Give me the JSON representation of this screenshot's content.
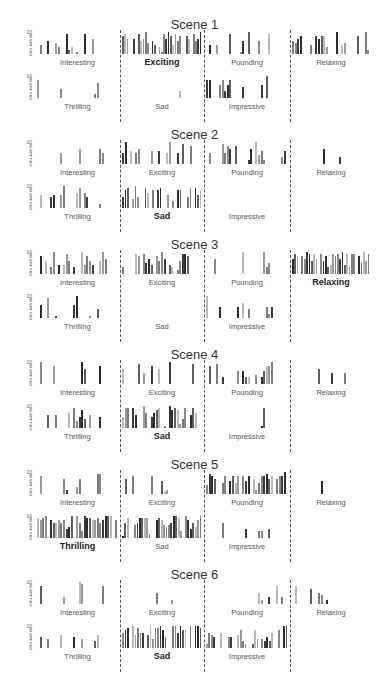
{
  "chart_data": {
    "type": "bar",
    "ylim": [
      0,
      10
    ],
    "yticks": [
      "10",
      "8",
      "6",
      "4",
      "2",
      "0"
    ],
    "categories_top_row": [
      "Interesting",
      "Exciting",
      "Pounding",
      "Relaxing"
    ],
    "categories_bottom_row": [
      "Thrilling",
      "Sad",
      "Impressive"
    ],
    "scenes": [
      {
        "title": "Scene 1",
        "highlight": "Exciting",
        "panels": {
          "Interesting": [
            0,
            4,
            0,
            0,
            6,
            0,
            0,
            5,
            3,
            0,
            0,
            9,
            2,
            3,
            0,
            1,
            0,
            0,
            9,
            0,
            0,
            7
          ],
          "Exciting": [
            8,
            9,
            7,
            0,
            0,
            7,
            0,
            9,
            6,
            7,
            10,
            5,
            0,
            6,
            4,
            0,
            3,
            1,
            9,
            7,
            10,
            8,
            4,
            9,
            6,
            8,
            0,
            0,
            8,
            7,
            0,
            9,
            6,
            7,
            10
          ],
          "Pounding": [
            0,
            4,
            0,
            0,
            4,
            0,
            0,
            0,
            0,
            9,
            0,
            0,
            0,
            1,
            6,
            0,
            10,
            0,
            0,
            0,
            6,
            0,
            0,
            0,
            9
          ],
          "Relaxing": [
            6,
            5,
            7,
            8,
            0,
            0,
            0,
            4,
            0,
            8,
            7,
            8,
            8,
            3,
            0,
            0,
            0,
            10,
            0,
            4,
            5,
            0,
            0,
            0,
            0,
            8,
            0,
            0,
            10,
            2
          ]
        },
        "panels_bottom": {
          "Thrilling": [
            8,
            0,
            0,
            0,
            0,
            0,
            0,
            0,
            0,
            4,
            0,
            0,
            0,
            0,
            0,
            0,
            0,
            0,
            0,
            0,
            0,
            0,
            2,
            7
          ],
          "Sad": [
            0,
            0,
            0,
            0,
            0,
            0,
            0,
            0,
            0,
            0,
            0,
            0,
            0,
            0,
            0,
            0,
            0,
            0,
            0,
            0,
            0,
            0,
            3,
            0
          ],
          "Impressive": [
            8,
            8,
            0,
            0,
            0,
            6,
            8,
            3,
            6,
            8,
            0,
            0,
            0,
            0,
            5,
            0,
            0,
            0,
            0,
            0,
            0,
            6,
            0,
            10
          ]
        }
      },
      {
        "title": "Scene 2",
        "highlight": "Sad",
        "panels": {
          "Interesting": [
            0,
            0,
            0,
            0,
            0,
            0,
            0,
            0,
            0,
            5,
            0,
            0,
            0,
            0,
            0,
            0,
            7,
            0,
            0,
            0,
            0,
            0,
            0,
            0,
            7,
            5
          ],
          "Exciting": [
            5,
            10,
            0,
            6,
            0,
            5,
            7,
            0,
            0,
            0,
            0,
            6,
            0,
            0,
            6,
            0,
            0,
            5,
            10,
            0,
            0,
            5,
            0,
            9,
            0,
            0,
            8
          ],
          "Pounding": [
            0,
            5,
            0,
            0,
            0,
            0,
            9,
            5,
            8,
            7,
            0,
            8,
            0,
            0,
            0,
            0,
            2,
            7,
            0,
            10,
            4,
            6,
            2,
            0,
            0,
            0,
            0,
            0,
            0,
            3,
            6
          ],
          "Relaxing": [
            0,
            0,
            0,
            0,
            0,
            0,
            0,
            0,
            0,
            0,
            0,
            0,
            7,
            0,
            0,
            0,
            0,
            0,
            3
          ]
        },
        "panels_bottom": {
          "Thrilling": [
            0,
            6,
            0,
            0,
            0,
            5,
            6,
            0,
            0,
            6,
            10,
            0,
            0,
            0,
            0,
            7,
            9,
            0,
            7,
            5,
            0,
            0,
            0,
            0,
            2
          ],
          "Sad": [
            5,
            8,
            9,
            0,
            4,
            10,
            5,
            0,
            0,
            9,
            7,
            0,
            8,
            0,
            8,
            9,
            0,
            0,
            6,
            0,
            3,
            0,
            8,
            8,
            0,
            0,
            5,
            9,
            0,
            9,
            6,
            8
          ],
          "Impressive": []
        }
      },
      {
        "title": "Scene 3",
        "highlight": "Relaxing",
        "panels": {
          "Interesting": [
            0,
            8,
            0,
            6,
            0,
            3,
            10,
            0,
            4,
            0,
            4,
            9,
            6,
            0,
            3,
            0,
            0,
            10,
            4,
            8,
            6,
            4,
            0,
            0,
            6,
            10,
            7
          ],
          "Exciting": [
            3,
            0,
            0,
            0,
            0,
            9,
            8,
            0,
            9,
            5,
            7,
            4,
            0,
            8,
            6,
            10,
            7,
            0,
            4,
            3,
            0,
            2,
            6,
            9,
            9,
            8
          ],
          "Pounding": [
            0,
            0,
            0,
            7,
            0,
            0,
            0,
            0,
            0,
            0,
            0,
            0,
            0,
            0,
            10,
            0,
            0,
            0,
            0,
            0,
            0,
            0,
            10,
            3,
            5
          ],
          "Relaxing": [
            7,
            9,
            8,
            0,
            8,
            7,
            10,
            9,
            6,
            9,
            7,
            0,
            9,
            6,
            8,
            3,
            4,
            9,
            8,
            9,
            7,
            10,
            4,
            9,
            3,
            9,
            9,
            0,
            8,
            5,
            10,
            6,
            9
          ]
        },
        "panels_bottom": {
          "Thrilling": [
            0,
            6,
            0,
            0,
            9,
            0,
            0,
            1,
            0,
            0,
            0,
            0,
            0,
            0,
            6,
            11,
            0,
            0,
            0,
            0,
            1,
            0,
            0,
            4
          ],
          "Sad": [],
          "Impressive": [
            10,
            0,
            0,
            0,
            0,
            5,
            0,
            0,
            0,
            0,
            0,
            0,
            5,
            0,
            7,
            0,
            4,
            0,
            0,
            0,
            0,
            0,
            0,
            5,
            2,
            5
          ]
        }
      },
      {
        "title": "Scene 4",
        "highlight": "Sad",
        "panels": {
          "Interesting": [
            0,
            10,
            0,
            0,
            0,
            0,
            8,
            0,
            0,
            0,
            0,
            0,
            0,
            0,
            0,
            0,
            0,
            10,
            7,
            0,
            0,
            0,
            0,
            0,
            8
          ],
          "Exciting": [
            7,
            0,
            0,
            0,
            0,
            0,
            9,
            0,
            5,
            0,
            0,
            8,
            0,
            0,
            7,
            0,
            0,
            0,
            10,
            0,
            0,
            0,
            0,
            0,
            0,
            0,
            0,
            9
          ],
          "Pounding": [
            0,
            8,
            0,
            0,
            9,
            0,
            3,
            0,
            0,
            0,
            0,
            0,
            6,
            0,
            6,
            3,
            3,
            0,
            0,
            4,
            0,
            3,
            6,
            8,
            8,
            11
          ],
          "Relaxing": [
            0,
            0,
            0,
            0,
            0,
            0,
            0,
            0,
            0,
            0,
            7,
            0,
            0,
            0,
            0,
            5,
            0,
            0,
            0,
            0,
            5
          ]
        },
        "panels_bottom": {
          "Thrilling": [
            0,
            0,
            0,
            0,
            6,
            0,
            0,
            6,
            0,
            0,
            0,
            0,
            7,
            0,
            9,
            3,
            5,
            8,
            4,
            0,
            6,
            0,
            0,
            0,
            5
          ],
          "Sad": [
            5,
            9,
            9,
            0,
            9,
            6,
            0,
            0,
            10,
            7,
            0,
            5,
            7,
            8,
            9,
            0,
            1,
            0,
            10,
            8,
            9,
            8,
            2,
            4,
            9,
            0,
            6,
            9,
            7
          ],
          "Impressive": [
            0,
            0,
            0,
            0,
            0,
            0,
            0,
            0,
            0,
            0,
            0,
            0,
            0,
            0,
            0,
            0,
            0,
            0,
            0,
            0,
            0,
            1,
            9
          ]
        }
      },
      {
        "title": "Scene 5",
        "highlight": "Thrilling",
        "panels": {
          "Interesting": [
            0,
            8,
            0,
            0,
            0,
            0,
            0,
            0,
            0,
            0,
            7,
            2,
            0,
            0,
            0,
            3,
            7,
            0,
            0,
            0,
            0,
            0,
            0,
            9,
            9
          ],
          "Exciting": [
            0,
            7,
            0,
            0,
            8,
            0,
            0,
            0,
            0,
            0,
            0,
            8,
            0,
            0,
            0,
            6,
            1,
            2
          ],
          "Pounding": [
            4,
            9,
            8,
            7,
            0,
            0,
            5,
            8,
            0,
            6,
            8,
            5,
            8,
            0,
            8,
            6,
            8,
            0,
            7,
            2,
            5,
            8,
            8,
            9,
            7,
            8,
            0,
            7,
            8,
            8,
            10
          ],
          "Relaxing": [
            0,
            0,
            0,
            0,
            0,
            0,
            0,
            0,
            0,
            0,
            0,
            6
          ]
        },
        "panels_bottom": {
          "Thrilling": [
            9,
            8,
            9,
            10,
            0,
            8,
            7,
            7,
            8,
            7,
            8,
            4,
            5,
            10,
            0,
            10,
            7,
            3,
            10,
            9,
            9,
            8,
            8,
            9,
            7,
            8,
            10,
            10,
            10,
            0,
            8
          ],
          "Sad": [
            1,
            7,
            9,
            0,
            0,
            6,
            7,
            9,
            9,
            9,
            9,
            2,
            0,
            0,
            8,
            9,
            8,
            6,
            5,
            6,
            7,
            10,
            10,
            9,
            3,
            0,
            10,
            8,
            4,
            7,
            5,
            8,
            10
          ],
          "Impressive": [
            0,
            0,
            0,
            0,
            0,
            0,
            7,
            0,
            0,
            0,
            0,
            0,
            0,
            0,
            0,
            4,
            0,
            0,
            0,
            0,
            3,
            3,
            0,
            0,
            4
          ]
        }
      },
      {
        "title": "Scene 6",
        "highlight": "Sad",
        "panels": {
          "Interesting": [
            0,
            8,
            0,
            0,
            0,
            0,
            0,
            0,
            0,
            0,
            3,
            0,
            0,
            0,
            0,
            0,
            10,
            9,
            0,
            0,
            0,
            0,
            0,
            0,
            0,
            8
          ],
          "Exciting": [
            0,
            0,
            0,
            0,
            0,
            0,
            0,
            0,
            0,
            0,
            0,
            0,
            0,
            5,
            0,
            0,
            0,
            0,
            0,
            2
          ],
          "Pounding": [
            0,
            0,
            0,
            0,
            0,
            0,
            0,
            0,
            0,
            0,
            0,
            0,
            0,
            0,
            0,
            0,
            0,
            0,
            0,
            0,
            5,
            2,
            0,
            0,
            3,
            0,
            0,
            8,
            0,
            3
          ],
          "Relaxing": [
            0,
            8,
            0,
            0,
            0,
            0,
            0,
            7,
            0,
            0,
            5,
            4,
            0,
            2
          ]
        },
        "panels_bottom": {
          "Thrilling": [
            0,
            5,
            0,
            0,
            4,
            0,
            0,
            0,
            0,
            6,
            0,
            0,
            0,
            0,
            5,
            0,
            0,
            4,
            0,
            0,
            0,
            0,
            3,
            6
          ],
          "Sad": [
            7,
            8,
            9,
            0,
            10,
            6,
            9,
            7,
            7,
            0,
            6,
            10,
            4,
            9,
            9,
            10,
            8,
            5,
            0,
            0,
            10,
            10,
            7,
            10,
            8,
            8,
            0,
            10,
            0,
            10,
            10,
            9
          ],
          "Impressive": [
            2,
            7,
            6,
            5,
            0,
            0,
            7,
            0,
            0,
            5,
            5,
            0,
            0,
            6,
            8,
            3,
            2,
            0,
            0,
            2,
            8,
            4,
            0,
            4,
            3,
            5,
            3,
            7,
            0,
            0,
            8,
            0,
            11,
            11
          ]
        }
      }
    ]
  },
  "scenes": [
    {
      "title": "Scene 1"
    },
    {
      "title": "Scene 2"
    },
    {
      "title": "Scene 3"
    },
    {
      "title": "Scene 4"
    },
    {
      "title": "Scene 5"
    },
    {
      "title": "Scene 6"
    }
  ],
  "labels": {
    "interesting": "Interesting",
    "exciting": "Exciting",
    "pounding": "Pounding",
    "relaxing": "Relaxing",
    "thrilling": "Thrilling",
    "sad": "Sad",
    "impressive": "Impressive"
  },
  "colors": {
    "bar_shades": [
      "#9a9a9a",
      "#5e5e5e",
      "#3a3a3a",
      "#7c7c7c",
      "#b9b9b9",
      "#2c2c2c",
      "#888888"
    ],
    "divider": "#555555"
  }
}
